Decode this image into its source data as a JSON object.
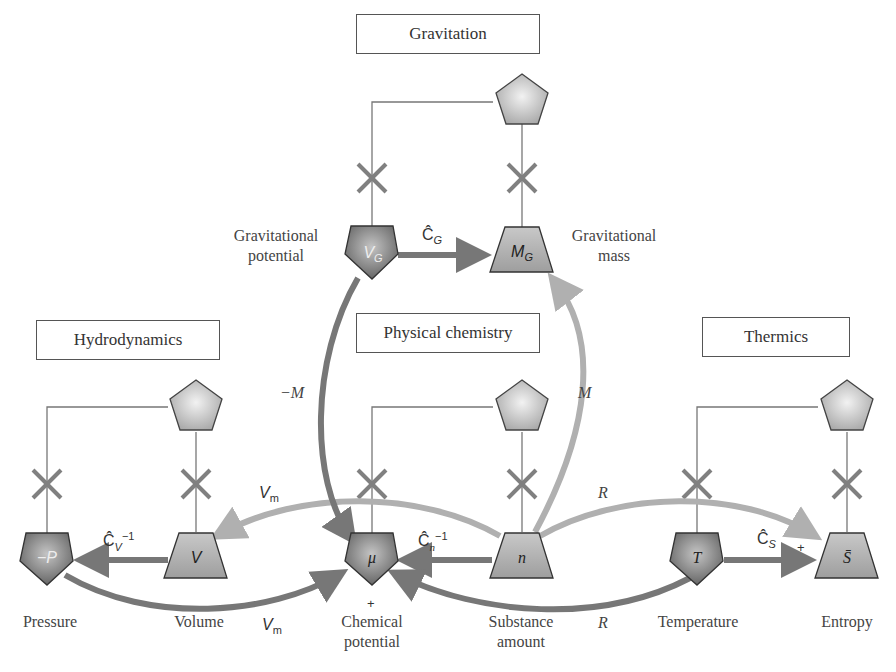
{
  "domains": {
    "gravitation": "Gravitation",
    "hydrodynamics": "Hydrodynamics",
    "physical_chemistry": "Physical chemistry",
    "thermics": "Thermics"
  },
  "nodes": {
    "gravitational_potential": {
      "symbol": "V",
      "sub": "G",
      "label_line1": "Gravitational",
      "label_line2": "potential",
      "shape": "pentagon-dark"
    },
    "gravitational_mass": {
      "symbol": "M",
      "sub": "G",
      "label_line1": "Gravitational",
      "label_line2": "mass",
      "shape": "trapezoid-light"
    },
    "pressure": {
      "symbol": "−P",
      "label": "Pressure",
      "shape": "pentagon-dark"
    },
    "volume": {
      "symbol": "V",
      "label": "Volume",
      "shape": "trapezoid-light"
    },
    "chemical_potential": {
      "symbol": "μ",
      "label_line1": "Chemical",
      "label_line2": "potential",
      "sign": "+",
      "shape": "pentagon-dark"
    },
    "substance_amount": {
      "symbol": "n",
      "label_line1": "Substance",
      "label_line2": "amount",
      "shape": "trapezoid-light"
    },
    "temperature": {
      "symbol": "T",
      "label": "Temperature",
      "shape": "pentagon-dark"
    },
    "entropy": {
      "symbol": "S̄",
      "label": "Entropy",
      "sign": "+",
      "shape": "trapezoid-light"
    }
  },
  "edges": {
    "cg": {
      "op": "Ĉ",
      "sub": "G"
    },
    "cv_inv": {
      "op": "Ĉ",
      "sub": "V",
      "sup": "−1"
    },
    "cn_inv": {
      "op": "Ĉ",
      "sub": "n",
      "sup": "−1"
    },
    "cs": {
      "op": "Ĉ",
      "sub": "S"
    },
    "minus_m": "−M",
    "m": "M",
    "vm_top": {
      "base": "V",
      "sub": "m"
    },
    "vm_bottom": {
      "base": "V",
      "sub": "m"
    },
    "r_top": "R",
    "r_bottom": "R"
  },
  "colors": {
    "dark_node": "#6e6e6e",
    "light_node": "#b4b4b4",
    "dark_arrow": "#777777",
    "light_arrow": "#b0b0b0",
    "line": "#777777",
    "cross": "#808080"
  }
}
